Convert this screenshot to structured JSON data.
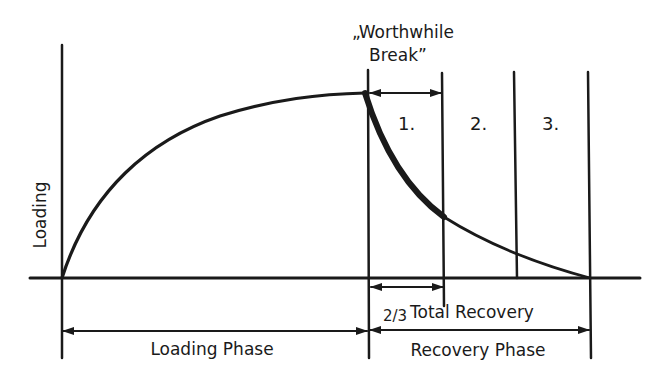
{
  "diagram": {
    "type": "loading-recovery-curve",
    "colors": {
      "ink": "#1a1a1a",
      "background": "#ffffff"
    },
    "labels": {
      "y_axis": "Loading",
      "worthwhile_break_line1": "„Worthwhile",
      "worthwhile_break_line2": "Break”",
      "segment_1": "1.",
      "segment_2": "2.",
      "segment_3": "3.",
      "two_thirds_fraction": "2/3",
      "two_thirds_text": "Total Recovery",
      "loading_phase": "Loading Phase",
      "recovery_phase": "Recovery Phase"
    },
    "phases": [
      {
        "name": "Loading Phase",
        "shape": "rising saturating curve from zero to peak"
      },
      {
        "name": "Recovery Phase",
        "shape": "decaying curve from peak back to zero",
        "segments": [
          "1.",
          "2.",
          "3."
        ]
      }
    ],
    "annotations": [
      {
        "label": "Worthwhile Break",
        "spans": "segment 1 (steepest early recovery)"
      },
      {
        "label": "2/3 Total Recovery",
        "spans": "segment 1"
      }
    ]
  }
}
